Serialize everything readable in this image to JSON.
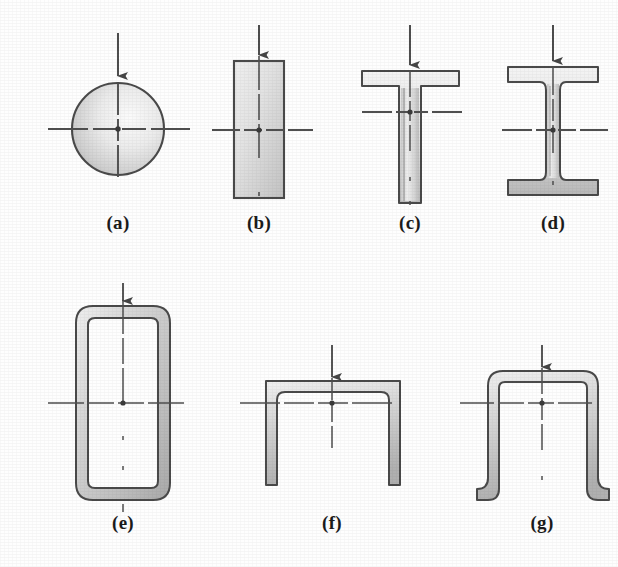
{
  "figure": {
    "kind": "engineering-cross-section-plate",
    "background_color": "#fefefe",
    "ink_color": "#3a3a3a",
    "outline_color": "#4a4a4a",
    "shade_light": "#f2f2f2",
    "shade_mid": "#cfcfcf",
    "shade_dark": "#a5a5a5",
    "axis_color": "#4f4f4f",
    "arrow_color": "#454545",
    "label_color": "#1b1b1b"
  },
  "panels": [
    {
      "id": "a",
      "label": "(a)",
      "shape_name": "solid-circular-section",
      "label_x": 88,
      "label_y": 222,
      "centroid": {
        "x": 118,
        "y": 129
      },
      "arrow": {
        "x": 118,
        "y_start": 33,
        "y_end": 83
      },
      "h_axis": {
        "x1": 48,
        "x2": 190,
        "y": 129
      },
      "v_axis": {
        "x": 118,
        "y1": 83,
        "y2": 198
      },
      "geometry": {
        "type": "circle",
        "cx": 118,
        "cy": 129,
        "r": 46
      }
    },
    {
      "id": "b",
      "label": "(b)",
      "shape_name": "solid-rectangular-section",
      "label_x": 229,
      "label_y": 222,
      "centroid": {
        "x": 259,
        "y": 130
      },
      "arrow": {
        "x": 259,
        "y_start": 25,
        "y_end": 61
      },
      "h_axis": {
        "x1": 212,
        "x2": 313,
        "y": 130
      },
      "v_axis": {
        "x": 259,
        "y1": 61,
        "y2": 207
      },
      "geometry": {
        "type": "rect",
        "x": 234,
        "y": 61,
        "w": 50,
        "h": 137
      }
    },
    {
      "id": "c",
      "label": "(c)",
      "shape_name": "tee-section",
      "label_x": 380,
      "label_y": 222,
      "centroid": {
        "x": 410,
        "y": 112
      },
      "arrow": {
        "x": 410,
        "y_start": 25,
        "y_end": 71
      },
      "h_axis": {
        "x1": 362,
        "x2": 466,
        "y": 112
      },
      "v_axis": {
        "x": 410,
        "y1": 71,
        "y2": 212
      },
      "geometry": {
        "type": "tee",
        "flange_x": 362,
        "flange_y": 71,
        "flange_w": 97,
        "flange_t": 15,
        "web_x": 399,
        "web_w": 21,
        "web_bottom": 203
      }
    },
    {
      "id": "d",
      "label": "(d)",
      "shape_name": "wide-flange-i-section",
      "label_x": 523,
      "label_y": 222,
      "centroid": {
        "x": 553,
        "y": 130
      },
      "arrow": {
        "x": 553,
        "y_start": 25,
        "y_end": 67
      },
      "h_axis": {
        "x1": 502,
        "x2": 608,
        "y": 130
      },
      "v_axis": {
        "x": 553,
        "y1": 67,
        "y2": 205
      },
      "geometry": {
        "type": "i-beam",
        "x": 508,
        "y": 67,
        "w": 90,
        "h": 128,
        "flange_t": 15,
        "web_t": 14
      }
    },
    {
      "id": "e",
      "label": "(e)",
      "shape_name": "rectangular-hollow-tube-section",
      "label_x": 93,
      "label_y": 520,
      "centroid": {
        "x": 123,
        "y": 403
      },
      "arrow": {
        "x": 123,
        "y_start": 283,
        "y_end": 308
      },
      "h_axis": {
        "x1": 48,
        "x2": 200,
        "y": 403
      },
      "v_axis": {
        "x": 123,
        "y1": 305,
        "y2": 510
      },
      "geometry": {
        "type": "tube",
        "x": 76,
        "y": 306,
        "w": 94,
        "h": 194,
        "t": 12,
        "radius": 17
      }
    },
    {
      "id": "f",
      "label": "(f)",
      "shape_name": "inverted-channel-section",
      "label_x": 302,
      "label_y": 520,
      "centroid": {
        "x": 332,
        "y": 403
      },
      "arrow": {
        "x": 332,
        "y_start": 345,
        "y_end": 381
      },
      "h_axis": {
        "x1": 240,
        "x2": 422,
        "y": 403
      },
      "v_axis": {
        "x": 332,
        "y1": 381,
        "y2": 460
      },
      "geometry": {
        "type": "channel-down",
        "x": 266,
        "y": 381,
        "w": 134,
        "h": 104,
        "t": 11,
        "radius": 16
      }
    },
    {
      "id": "g",
      "label": "(g)",
      "shape_name": "hat-section-with-lips",
      "label_x": 512,
      "label_y": 520,
      "centroid": {
        "x": 542,
        "y": 403
      },
      "arrow": {
        "x": 542,
        "y_start": 345,
        "y_end": 371
      },
      "h_axis": {
        "x1": 460,
        "x2": 622,
        "y": 403
      },
      "v_axis": {
        "x": 542,
        "y1": 371,
        "y2": 490
      },
      "geometry": {
        "type": "hat",
        "x": 488,
        "y": 371,
        "w": 110,
        "h": 122,
        "t": 11,
        "radius": 15,
        "lip": 22
      }
    }
  ]
}
